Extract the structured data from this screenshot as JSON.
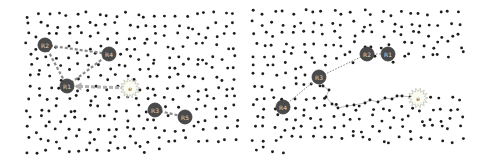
{
  "figure": {
    "colors": {
      "background": "#ffffff",
      "dot": "#1e1e1e",
      "robot_fill": "#4a4a4a",
      "robot_stroke": "#3a3a3a",
      "robot_label": "#d8d8d8",
      "dashed_link": "#8a8a8a",
      "arrow": "#b0b0b0",
      "path_line": "#b5b5b5",
      "target_fill": "#fbfbf2",
      "target_stroke": "#b0b0a8"
    },
    "panels": [
      {
        "id": "left",
        "bounds": {
          "x0": 24,
          "y0": 10,
          "x1": 240,
          "y1": 155
        },
        "seed": 17,
        "dot_count": 300,
        "robots": [
          {
            "label": "R2",
            "x": 45,
            "y": 45
          },
          {
            "label": "R4",
            "x": 109,
            "y": 54
          },
          {
            "label": "R1",
            "x": 67,
            "y": 86
          },
          {
            "label": "R3",
            "x": 155,
            "y": 110
          },
          {
            "label": "R5",
            "x": 185,
            "y": 117
          }
        ],
        "target": {
          "label": "e",
          "x": 130,
          "y": 88
        },
        "dashed_links": [
          [
            "R2",
            "R4"
          ],
          [
            "R2",
            "R1"
          ],
          [
            "R1",
            "R4"
          ],
          [
            "R3",
            "R5"
          ]
        ],
        "arrow": {
          "from": "target",
          "to": "R1"
        },
        "path": []
      },
      {
        "id": "right",
        "bounds": {
          "x0": 250,
          "y0": 8,
          "x1": 465,
          "y1": 155
        },
        "seed": 53,
        "dot_count": 290,
        "clear_region": [
          [
            316,
            66
          ],
          [
            400,
            62
          ],
          [
            462,
            60
          ],
          [
            462,
            94
          ],
          [
            430,
            97
          ],
          [
            400,
            100
          ],
          [
            340,
            108
          ],
          [
            328,
            96
          ]
        ],
        "robots": [
          {
            "label": "R2",
            "x": 367,
            "y": 54
          },
          {
            "label": "R1",
            "x": 388,
            "y": 54
          },
          {
            "label": "R3",
            "x": 319,
            "y": 77
          },
          {
            "label": "R4",
            "x": 283,
            "y": 107
          }
        ],
        "target": {
          "label": "e",
          "x": 418,
          "y": 98
        },
        "dashed_links": [
          [
            "R4",
            "R3"
          ],
          [
            "R3",
            "R2"
          ],
          [
            "R2",
            "R1"
          ]
        ],
        "arrow": null,
        "path": [
          [
            319,
            77
          ],
          [
            323,
            86
          ],
          [
            329,
            90
          ],
          [
            326,
            97
          ],
          [
            332,
            104
          ],
          [
            338,
            108
          ],
          [
            347,
            106
          ],
          [
            354,
            105
          ],
          [
            365,
            103
          ],
          [
            370,
            100
          ],
          [
            378,
            102
          ],
          [
            385,
            98
          ],
          [
            392,
            99
          ],
          [
            397,
            96
          ],
          [
            402,
            96
          ],
          [
            410,
            97
          ],
          [
            418,
            98
          ]
        ]
      }
    ]
  }
}
